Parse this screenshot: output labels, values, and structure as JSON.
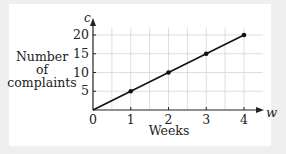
{
  "chart_data": {
    "type": "line",
    "title": "",
    "xlabel": "Weeks",
    "ylabel": "Number of complaints",
    "x_axis_var": "w",
    "y_axis_var": "c",
    "x": [
      0,
      1,
      2,
      3,
      4
    ],
    "series": [
      {
        "name": "c",
        "values": [
          0,
          5,
          10,
          15,
          20
        ],
        "markers_at": [
          1,
          2,
          3,
          4
        ]
      }
    ],
    "x_ticks": [
      "0",
      "1",
      "2",
      "3",
      "4"
    ],
    "y_ticks": [
      "5",
      "10",
      "15",
      "20"
    ],
    "xlim": [
      0,
      4.5
    ],
    "ylim": [
      0,
      22
    ],
    "grid": true,
    "legend": "none",
    "colors": {
      "line": "#111111",
      "grid": "#d6d6d6",
      "axis": "#222222",
      "background": "#ffffff",
      "page": "#efefef"
    }
  },
  "labels": {
    "ylabel_lines": [
      "Number",
      "of",
      "complaints"
    ],
    "xlabel": "Weeks",
    "x_var": "w",
    "y_var": "c"
  }
}
